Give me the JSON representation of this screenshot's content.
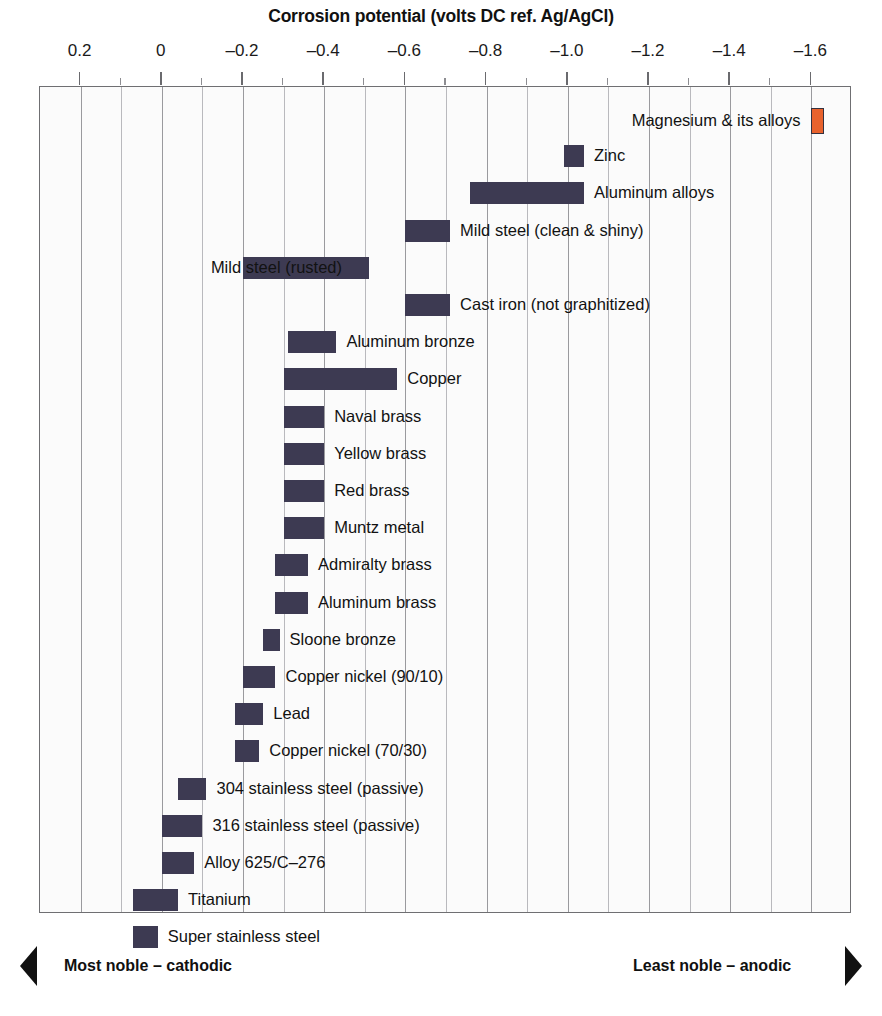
{
  "chart_data": {
    "type": "bar",
    "orientation": "horizontal-range",
    "title": "Corrosion potential (volts DC ref. Ag/AgCl)",
    "xlabel": "Corrosion potential (volts DC ref. Ag/AgCl)",
    "ylabel": "",
    "xlim": [
      0.3,
      -1.7
    ],
    "x_ticks": [
      0.2,
      0,
      -0.2,
      -0.4,
      -0.6,
      -0.8,
      -1.0,
      -1.2,
      -1.4,
      -1.6
    ],
    "x_tick_labels": [
      "0.2",
      "0",
      "–0.2",
      "–0.4",
      "–0.6",
      "–0.8",
      "–1.0",
      "–1.2",
      "–1.4",
      "–1.6"
    ],
    "minor_tick_step": 0.1,
    "grid": true,
    "legend": null,
    "bar_color": "#3d3a52",
    "accent_color": "#e8622d",
    "categories": [
      "Magnesium & its alloys",
      "Zinc",
      "Aluminum alloys",
      "Mild steel (clean & shiny)",
      "Mild steel (rusted)",
      "Cast iron (not graphitized)",
      "Aluminum bronze",
      "Copper",
      "Naval brass",
      "Yellow brass",
      "Red brass",
      "Muntz metal",
      "Admiralty brass",
      "Aluminum brass",
      "Sloone bronze",
      "Copper nickel (90/10)",
      "Lead",
      "Copper nickel (70/30)",
      "304 stainless steel (passive)",
      "316 stainless steel (passive)",
      "Alloy 625/C–276",
      "Titanium",
      "Super stainless steel"
    ],
    "ranges": [
      {
        "label": "Magnesium & its alloys",
        "min": -1.6,
        "max": -1.63,
        "highlight": true,
        "label_side": "left"
      },
      {
        "label": "Zinc",
        "min": -0.99,
        "max": -1.04,
        "highlight": false,
        "label_side": "right"
      },
      {
        "label": "Aluminum alloys",
        "min": -0.76,
        "max": -1.04,
        "highlight": false,
        "label_side": "right"
      },
      {
        "label": "Mild steel (clean & shiny)",
        "min": -0.6,
        "max": -0.71,
        "highlight": false,
        "label_side": "right"
      },
      {
        "label": "Mild steel (rusted)",
        "min": -0.2,
        "max": -0.51,
        "highlight": false,
        "label_side": "right"
      },
      {
        "label": "Cast iron (not graphitized)",
        "min": -0.6,
        "max": -0.71,
        "highlight": false,
        "label_side": "right"
      },
      {
        "label": "Aluminum bronze",
        "min": -0.31,
        "max": -0.43,
        "highlight": false,
        "label_side": "right"
      },
      {
        "label": "Copper",
        "min": -0.3,
        "max": -0.58,
        "highlight": false,
        "label_side": "right"
      },
      {
        "label": "Naval brass",
        "min": -0.3,
        "max": -0.4,
        "highlight": false,
        "label_side": "right"
      },
      {
        "label": "Yellow brass",
        "min": -0.3,
        "max": -0.4,
        "highlight": false,
        "label_side": "right"
      },
      {
        "label": "Red brass",
        "min": -0.3,
        "max": -0.4,
        "highlight": false,
        "label_side": "right"
      },
      {
        "label": "Muntz metal",
        "min": -0.3,
        "max": -0.4,
        "highlight": false,
        "label_side": "right"
      },
      {
        "label": "Admiralty brass",
        "min": -0.28,
        "max": -0.36,
        "highlight": false,
        "label_side": "right"
      },
      {
        "label": "Aluminum brass",
        "min": -0.28,
        "max": -0.36,
        "highlight": false,
        "label_side": "right"
      },
      {
        "label": "Sloone bronze",
        "min": -0.25,
        "max": -0.29,
        "highlight": false,
        "label_side": "right"
      },
      {
        "label": "Copper nickel (90/10)",
        "min": -0.2,
        "max": -0.28,
        "highlight": false,
        "label_side": "right"
      },
      {
        "label": "Lead",
        "min": -0.18,
        "max": -0.25,
        "highlight": false,
        "label_side": "right"
      },
      {
        "label": "Copper nickel (70/30)",
        "min": -0.18,
        "max": -0.24,
        "highlight": false,
        "label_side": "right"
      },
      {
        "label": "304 stainless steel (passive)",
        "min": -0.04,
        "max": -0.11,
        "highlight": false,
        "label_side": "right"
      },
      {
        "label": "316 stainless steel (passive)",
        "min": 0.0,
        "max": -0.1,
        "highlight": false,
        "label_side": "right"
      },
      {
        "label": "Alloy 625/C–276",
        "min": 0.0,
        "max": -0.08,
        "highlight": false,
        "label_side": "right"
      },
      {
        "label": "Titanium",
        "min": 0.07,
        "max": -0.04,
        "highlight": false,
        "label_side": "right"
      },
      {
        "label": "Super stainless steel",
        "min": 0.07,
        "max": 0.01,
        "highlight": false,
        "label_side": "right"
      }
    ],
    "annotations": [
      {
        "name": "most-noble",
        "text": "Most noble – cathodic",
        "position": "bottom-left"
      },
      {
        "name": "least-noble",
        "text": "Least noble – anodic",
        "position": "bottom-right"
      }
    ]
  },
  "footer": {
    "left_label": "Most noble – cathodic",
    "right_label": "Least noble – anodic"
  }
}
